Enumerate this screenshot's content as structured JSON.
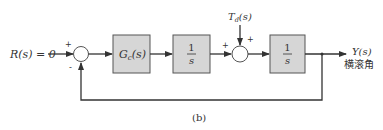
{
  "diagram": {
    "type": "block-diagram",
    "caption": "(b)",
    "input": {
      "label": "R(s) = 0"
    },
    "disturbance": {
      "label": "T_d(s)",
      "main": "T",
      "sub": "d",
      "arg": "(s)"
    },
    "output": {
      "label": "Y(s)",
      "sublabel": "横滚角"
    },
    "blocks": [
      {
        "id": "controller",
        "label": "G_c(s)",
        "main": "G",
        "sub": "c",
        "arg": "(s)"
      },
      {
        "id": "integrator1",
        "numerator": "1",
        "denominator": "s"
      },
      {
        "id": "integrator2",
        "numerator": "1",
        "denominator": "s"
      }
    ],
    "summing_junctions": [
      {
        "id": "sum1",
        "inputs": [
          {
            "from": "R(s)",
            "sign": "+"
          },
          {
            "from": "feedback Y(s)",
            "sign": "-"
          }
        ]
      },
      {
        "id": "sum2",
        "inputs": [
          {
            "from": "integrator1",
            "sign": "+"
          },
          {
            "from": "T_d(s)",
            "sign": "+"
          }
        ]
      }
    ],
    "signs": {
      "plus": "+",
      "minus": "-"
    },
    "connections": [
      "R(s) -> sum1(+)",
      "sum1 -> G_c(s)",
      "G_c(s) -> 1/s",
      "1/s -> sum2(+)",
      "T_d(s) -> sum2(+)",
      "sum2 -> 1/s",
      "1/s -> Y(s)",
      "Y(s) -> sum1(-) (unity feedback)"
    ]
  }
}
